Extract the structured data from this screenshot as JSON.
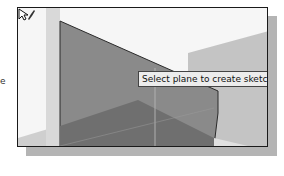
{
  "side_label": "e",
  "viewport": {
    "tooltip": "Select plane to create sketch or an",
    "cursor": "select-plane-cursor"
  },
  "colors": {
    "plane_front": "#8c8c8c",
    "plane_side": "#b8b8b8",
    "plane_bottom": "#6e6e6e",
    "frame_border": "#1a1a1a",
    "shadow": "#b4b4b4"
  }
}
